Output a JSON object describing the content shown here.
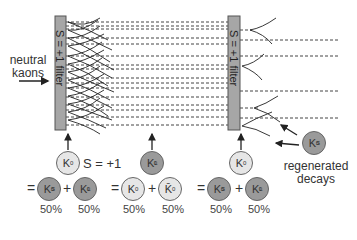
{
  "input_label": [
    "neutral",
    "kaons"
  ],
  "filters": [
    {
      "label": "S = +1 filter",
      "x": 55,
      "y": 16,
      "w": 11,
      "h": 114
    },
    {
      "label": "S = +1 filter",
      "x": 228,
      "y": 16,
      "w": 12,
      "h": 114
    }
  ],
  "strangeness_note": "S = +1",
  "regenerated_label": [
    "regenerated",
    "decays"
  ],
  "groups": [
    {
      "top": {
        "symbol": "K",
        "sup": "0",
        "sub": "",
        "shade": "light"
      },
      "left": {
        "symbol": "K",
        "sup": "0",
        "sub": "S",
        "shade": "dark",
        "pct": "50%"
      },
      "right": {
        "symbol": "K",
        "sup": "0",
        "sub": "L",
        "shade": "dark",
        "pct": "50%"
      }
    },
    {
      "top": {
        "symbol": "K",
        "sup": "0",
        "sub": "L",
        "shade": "dark"
      },
      "left": {
        "symbol": "K",
        "sup": "0",
        "sub": "",
        "shade": "light",
        "pct": "50%"
      },
      "right": {
        "symbol": "K̄",
        "sup": "0",
        "sub": "",
        "shade": "light",
        "pct": "50%"
      }
    },
    {
      "top": {
        "symbol": "K",
        "sup": "0",
        "sub": "",
        "shade": "light"
      },
      "left": {
        "symbol": "K",
        "sup": "0",
        "sub": "S",
        "shade": "dark",
        "pct": "50%"
      },
      "right": {
        "symbol": "K",
        "sup": "0",
        "sub": "L",
        "shade": "dark",
        "pct": "50%"
      }
    }
  ],
  "regenerated_particle": {
    "symbol": "K",
    "sup": "0",
    "sub": "S",
    "shade": "dark"
  },
  "operators": {
    "equals": "=",
    "plus": "+"
  },
  "colors": {
    "filter_fill": "#a6a6a6",
    "filter_stroke": "#555555",
    "dark_circle": "#9a9a9a",
    "light_circle": "#e6e6e6",
    "line": "#333333"
  }
}
